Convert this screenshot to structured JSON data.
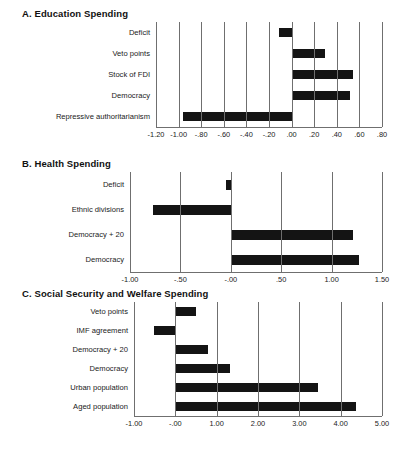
{
  "figure": {
    "background": "#ffffff",
    "bar_color": "#141414",
    "axis_color": "#6f6f6f"
  },
  "chart_data": [
    {
      "type": "bar",
      "orientation": "horizontal",
      "title": "A. Education Spending",
      "xlabel": "",
      "ylabel": "",
      "grid": true,
      "legend": "none",
      "xlim": [
        -1.2,
        0.8
      ],
      "xticks": [
        -1.2,
        -1.0,
        -0.8,
        -0.6,
        -0.4,
        -0.2,
        0.0,
        0.2,
        0.4,
        0.6,
        0.8
      ],
      "xticklabels": [
        "-1.20",
        "-1.00",
        "-.80",
        "-.60",
        "-.40",
        "-.20",
        ".00",
        ".20",
        ".40",
        ".60",
        ".80"
      ],
      "categories": [
        "Deficit",
        "Veto points",
        "Stock of FDI",
        "Democracy",
        "Repressive authoritarianism"
      ],
      "values": [
        -0.11,
        0.3,
        0.54,
        0.52,
        -0.96
      ]
    },
    {
      "type": "bar",
      "orientation": "horizontal",
      "title": "B. Health Spending",
      "xlabel": "",
      "ylabel": "",
      "grid": true,
      "legend": "none",
      "xlim": [
        -1.0,
        1.5
      ],
      "xticks": [
        -1.0,
        -0.5,
        0.0,
        0.5,
        1.0,
        1.5
      ],
      "xticklabels": [
        "-1.00",
        "-.50",
        "-.00",
        ".50",
        "1.00",
        "1.50"
      ],
      "categories": [
        "Deficit",
        "Ethnic divisions",
        "Democracy + 20",
        "Democracy"
      ],
      "values": [
        -0.05,
        -0.77,
        1.21,
        1.27
      ]
    },
    {
      "type": "bar",
      "orientation": "horizontal",
      "title": "C. Social Security and Welfare Spending",
      "xlabel": "",
      "ylabel": "",
      "grid": true,
      "legend": "none",
      "xlim": [
        -1.0,
        5.0
      ],
      "xticks": [
        -1.0,
        0.0,
        1.0,
        2.0,
        3.0,
        4.0,
        5.0
      ],
      "xticklabels": [
        "-1.00",
        "-.00",
        "1.00",
        "2.00",
        "3.00",
        "4.00",
        "5.00"
      ],
      "categories": [
        "Veto points",
        "IMF agreement",
        "Democracy + 20",
        "Democracy",
        "Urban population",
        "Aged population"
      ],
      "values": [
        0.49,
        -0.52,
        0.8,
        1.33,
        3.45,
        4.36
      ]
    }
  ]
}
